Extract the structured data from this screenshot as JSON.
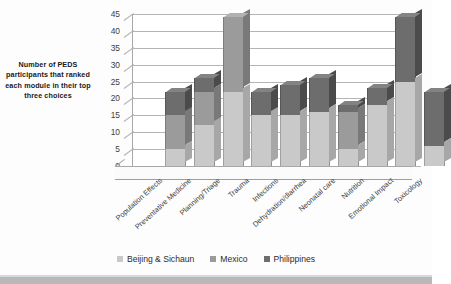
{
  "chart_data": {
    "type": "bar",
    "subtype": "stacked-column-3d",
    "title": "",
    "xlabel": "",
    "ylabel": "Number of PEDS participants that ranked each module in their top three choices",
    "ylim": [
      0,
      45
    ],
    "ytick_step": 5,
    "yticks": [
      "45",
      "40",
      "35",
      "30",
      "25",
      "20",
      "15",
      "10",
      "5",
      "0"
    ],
    "grid": true,
    "legend_position": "bottom",
    "categories": [
      "Population Effects",
      "Preventative Medicine",
      "Planning/Triage",
      "Trauma",
      "Infections",
      "Dehydration/diarrhea",
      "Neonatal care",
      "Nutrition",
      "Emotional Impact",
      "Toxicology"
    ],
    "series": [
      {
        "name": "Beijing & Sichaun",
        "color": "#c9c9c9",
        "values": [
          5,
          12,
          22,
          15,
          15,
          16,
          5,
          18,
          25,
          6
        ]
      },
      {
        "name": "Mexico",
        "color": "#9b9b9b",
        "values": [
          10,
          10,
          22,
          0,
          0,
          0,
          11,
          0,
          0,
          0
        ]
      },
      {
        "name": "Philippines",
        "color": "#6d6d6d",
        "values": [
          7,
          4,
          0,
          7,
          9,
          10,
          2,
          5,
          19,
          16
        ]
      }
    ],
    "totals": [
      22,
      26,
      44,
      22,
      24,
      26,
      18,
      23,
      44,
      22
    ]
  },
  "legend": {
    "items": [
      {
        "label": "Beijing & Sichaun",
        "color": "#c9c9c9"
      },
      {
        "label": "Mexico",
        "color": "#9b9b9b"
      },
      {
        "label": "Philippines",
        "color": "#6d6d6d"
      }
    ]
  },
  "axis": {
    "y_title": "Number of PEDS participants that ranked each module in their top three choices"
  }
}
